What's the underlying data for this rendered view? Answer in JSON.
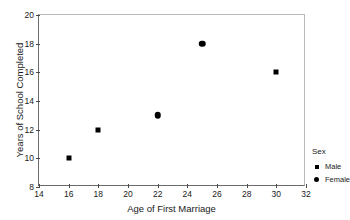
{
  "chart_data": {
    "type": "scatter",
    "title": "",
    "xlabel": "Age of First Marriage",
    "ylabel": "Years of School Completed",
    "xlim": [
      14,
      32
    ],
    "ylim": [
      8,
      20
    ],
    "xticks": [
      14,
      16,
      18,
      20,
      22,
      24,
      26,
      28,
      30,
      32
    ],
    "yticks": [
      8,
      10,
      12,
      14,
      16,
      18,
      20
    ],
    "grid": false,
    "legend": {
      "title": "Sex",
      "position": "outside-bottom-right",
      "entries": [
        {
          "name": "Male",
          "marker": "square"
        },
        {
          "name": "Female",
          "marker": "circle"
        }
      ]
    },
    "series": [
      {
        "name": "Male",
        "marker": "square",
        "color": "#000000",
        "points": [
          {
            "x": 16,
            "y": 10
          },
          {
            "x": 18,
            "y": 12
          },
          {
            "x": 30,
            "y": 16
          }
        ]
      },
      {
        "name": "Female",
        "marker": "circle",
        "color": "#000000",
        "points": [
          {
            "x": 22,
            "y": 13
          },
          {
            "x": 25,
            "y": 18
          }
        ]
      }
    ]
  }
}
